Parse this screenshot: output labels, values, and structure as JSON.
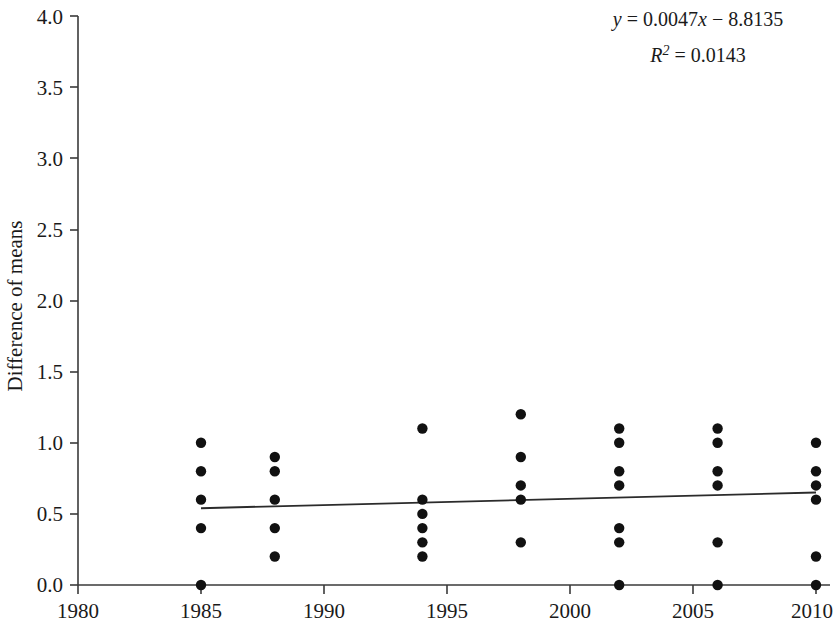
{
  "chart_data": {
    "type": "scatter",
    "title": "",
    "xlabel": "",
    "ylabel": "Difference of means",
    "xlim": [
      1980,
      2010
    ],
    "ylim": [
      0.0,
      4.0
    ],
    "xticks": [
      1980,
      1985,
      1990,
      1995,
      2000,
      2005,
      2010
    ],
    "xtick_labels": [
      "1980",
      "1985",
      "1990",
      "1995",
      "2000",
      "2005",
      "2010"
    ],
    "yticks": [
      0.0,
      0.5,
      1.0,
      1.5,
      2.0,
      2.5,
      3.0,
      3.5,
      4.0
    ],
    "ytick_labels": [
      "0.0",
      "0.5",
      "1.0",
      "1.5",
      "2.0",
      "2.5",
      "3.0",
      "3.5",
      "4.0"
    ],
    "grid": false,
    "legend": false,
    "marker": "filled-circle",
    "marker_color": "#111111",
    "points": [
      {
        "x": 1985,
        "y": 1.0
      },
      {
        "x": 1985,
        "y": 0.8
      },
      {
        "x": 1985,
        "y": 0.6
      },
      {
        "x": 1985,
        "y": 0.4
      },
      {
        "x": 1985,
        "y": 0.0
      },
      {
        "x": 1988,
        "y": 0.9
      },
      {
        "x": 1988,
        "y": 0.8
      },
      {
        "x": 1988,
        "y": 0.6
      },
      {
        "x": 1988,
        "y": 0.4
      },
      {
        "x": 1988,
        "y": 0.2
      },
      {
        "x": 1994,
        "y": 1.1
      },
      {
        "x": 1994,
        "y": 0.6
      },
      {
        "x": 1994,
        "y": 0.5
      },
      {
        "x": 1994,
        "y": 0.4
      },
      {
        "x": 1994,
        "y": 0.3
      },
      {
        "x": 1994,
        "y": 0.2
      },
      {
        "x": 1998,
        "y": 1.2
      },
      {
        "x": 1998,
        "y": 0.9
      },
      {
        "x": 1998,
        "y": 0.7
      },
      {
        "x": 1998,
        "y": 0.6
      },
      {
        "x": 1998,
        "y": 0.3
      },
      {
        "x": 2002,
        "y": 1.1
      },
      {
        "x": 2002,
        "y": 1.0
      },
      {
        "x": 2002,
        "y": 0.8
      },
      {
        "x": 2002,
        "y": 0.7
      },
      {
        "x": 2002,
        "y": 0.4
      },
      {
        "x": 2002,
        "y": 0.3
      },
      {
        "x": 2002,
        "y": 0.0
      },
      {
        "x": 2006,
        "y": 1.1
      },
      {
        "x": 2006,
        "y": 1.0
      },
      {
        "x": 2006,
        "y": 0.8
      },
      {
        "x": 2006,
        "y": 0.7
      },
      {
        "x": 2006,
        "y": 0.3
      },
      {
        "x": 2006,
        "y": 0.0
      },
      {
        "x": 2010,
        "y": 1.0
      },
      {
        "x": 2010,
        "y": 0.8
      },
      {
        "x": 2010,
        "y": 0.7
      },
      {
        "x": 2010,
        "y": 0.6
      },
      {
        "x": 2010,
        "y": 0.2
      },
      {
        "x": 2010,
        "y": 0.0
      }
    ],
    "trendline": {
      "slope": 0.0047,
      "intercept": -8.8135,
      "x_start": 1985,
      "x_end": 2010,
      "y_start": 0.54,
      "y_end": 0.65,
      "color": "#2b2b2b"
    },
    "annotations": {
      "equation_y": "y",
      "equation_body": " = 0.0047",
      "equation_x": "x",
      "equation_tail": " − 8.8135",
      "r_squared_symbol": "R",
      "r_squared_exponent": "2",
      "r_squared_value": " = 0.0143",
      "equation_full": "y = 0.0047x − 8.8135",
      "r_squared_full": "R² = 0.0143"
    }
  }
}
